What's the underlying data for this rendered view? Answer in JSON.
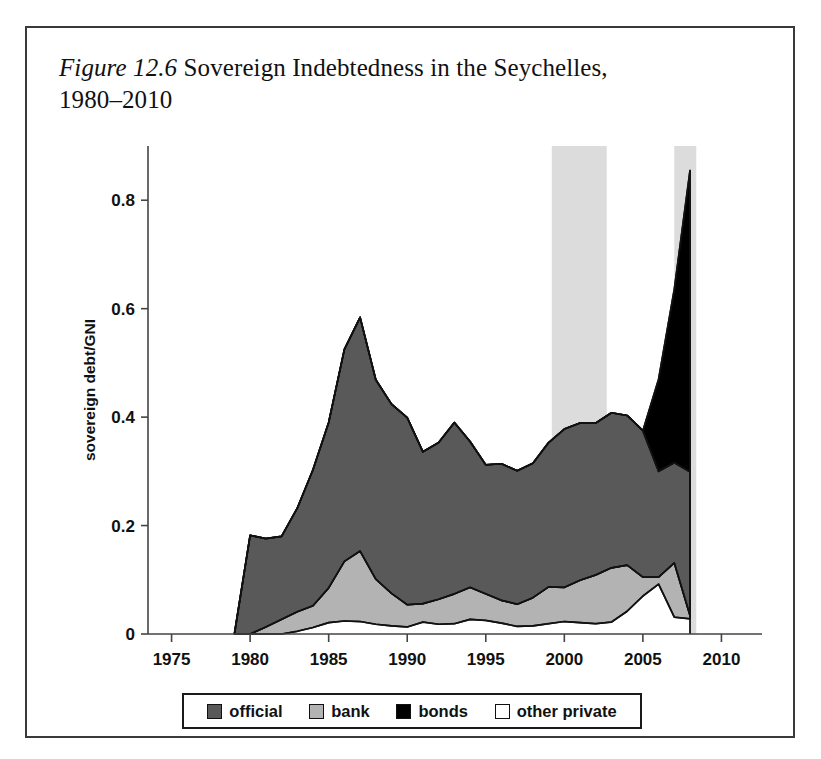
{
  "figure": {
    "number_label": "Figure 12.6",
    "caption_line1": " Sovereign Indebtedness in the Seychelles,",
    "caption_line2": "1980–2010"
  },
  "legend": {
    "entries": [
      {
        "label": "official",
        "color": "#595959"
      },
      {
        "label": "bank",
        "color": "#b3b3b3"
      },
      {
        "label": "bonds",
        "color": "#000000"
      },
      {
        "label": "other private",
        "color": "#ffffff"
      }
    ]
  },
  "axes": {
    "y_title": "sovereign debt/GNI",
    "y_ticks": [
      "0",
      "0.2",
      "0.4",
      "0.6",
      "0.8"
    ],
    "y_tick_values": [
      0,
      0.2,
      0.4,
      0.6,
      0.8
    ],
    "x_ticks": [
      "1975",
      "1980",
      "1985",
      "1990",
      "1995",
      "2000",
      "2005",
      "2010"
    ],
    "x_tick_values": [
      1975,
      1980,
      1985,
      1990,
      1995,
      2000,
      2005,
      2010
    ]
  },
  "chart_data": {
    "type": "area",
    "title": "Figure 12.6 Sovereign Indebtedness in the Seychelles, 1980–2010",
    "xlabel": "",
    "ylabel": "sovereign debt/GNI",
    "xlim": [
      1973.5,
      2011.5
    ],
    "ylim": [
      0,
      0.9
    ],
    "grid": false,
    "legend_position": "bottom",
    "stacked": true,
    "stack_order": [
      "other private",
      "bank",
      "official",
      "bonds"
    ],
    "x": [
      1979,
      1980,
      1981,
      1982,
      1983,
      1984,
      1985,
      1986,
      1987,
      1988,
      1989,
      1990,
      1991,
      1992,
      1993,
      1994,
      1995,
      1996,
      1997,
      1998,
      1999,
      2000,
      2001,
      2002,
      2003,
      2004,
      2005,
      2006,
      2007,
      2008
    ],
    "series": [
      {
        "name": "other private",
        "color": "#ffffff",
        "values": [
          0.0,
          0.0,
          0.0,
          0.0,
          0.005,
          0.012,
          0.021,
          0.024,
          0.023,
          0.018,
          0.015,
          0.013,
          0.022,
          0.018,
          0.019,
          0.027,
          0.025,
          0.02,
          0.014,
          0.015,
          0.019,
          0.023,
          0.021,
          0.019,
          0.022,
          0.042,
          0.07,
          0.092,
          0.031,
          0.028
        ]
      },
      {
        "name": "bank",
        "color": "#b3b3b3",
        "values": [
          0.0,
          0.0,
          0.013,
          0.027,
          0.036,
          0.04,
          0.064,
          0.11,
          0.13,
          0.083,
          0.06,
          0.041,
          0.034,
          0.046,
          0.055,
          0.059,
          0.049,
          0.042,
          0.041,
          0.052,
          0.068,
          0.063,
          0.078,
          0.09,
          0.1,
          0.085,
          0.035,
          0.013,
          0.1,
          0.006
        ]
      },
      {
        "name": "official",
        "color": "#595959",
        "values": [
          0.0,
          0.182,
          0.163,
          0.153,
          0.191,
          0.251,
          0.305,
          0.391,
          0.431,
          0.368,
          0.349,
          0.345,
          0.28,
          0.289,
          0.316,
          0.269,
          0.238,
          0.252,
          0.246,
          0.248,
          0.266,
          0.292,
          0.29,
          0.28,
          0.286,
          0.276,
          0.27,
          0.195,
          0.185,
          0.265
        ]
      },
      {
        "name": "bonds",
        "color": "#000000",
        "values": [
          0.0,
          0.0,
          0.0,
          0.0,
          0.0,
          0.0,
          0.0,
          0.0,
          0.0,
          0.0,
          0.0,
          0.0,
          0.0,
          0.0,
          0.0,
          0.0,
          0.0,
          0.0,
          0.0,
          0.0,
          0.0,
          0.0,
          0.0,
          0.0,
          0.0,
          0.0,
          0.0,
          0.17,
          0.32,
          0.556
        ]
      }
    ],
    "shaded_bands": [
      {
        "start": 1999.2,
        "end": 2002.7,
        "color": "#dcdcdc"
      },
      {
        "start": 2007.0,
        "end": 2008.4,
        "color": "#dcdcdc"
      }
    ],
    "annotations": []
  }
}
